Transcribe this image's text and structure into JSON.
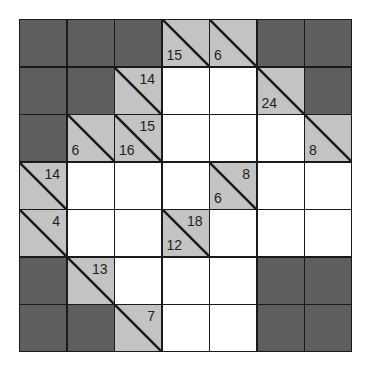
{
  "puzzle": {
    "type": "kakuro",
    "rows": 7,
    "cols": 7,
    "colors": {
      "blocked": "#5e5e5e",
      "clue": "#c3c3c3",
      "empty": "#ffffff",
      "line": "#1a1a1a"
    },
    "grid": [
      [
        {
          "t": "blocked"
        },
        {
          "t": "blocked"
        },
        {
          "t": "blocked"
        },
        {
          "t": "clue",
          "down": "15"
        },
        {
          "t": "clue",
          "down": "6"
        },
        {
          "t": "blocked"
        },
        {
          "t": "blocked"
        }
      ],
      [
        {
          "t": "blocked"
        },
        {
          "t": "blocked"
        },
        {
          "t": "clue",
          "across": "14"
        },
        {
          "t": "empty"
        },
        {
          "t": "empty"
        },
        {
          "t": "clue",
          "down": "24"
        },
        {
          "t": "blocked"
        }
      ],
      [
        {
          "t": "blocked"
        },
        {
          "t": "clue",
          "down": "6"
        },
        {
          "t": "clue",
          "across": "15",
          "down": "16"
        },
        {
          "t": "empty"
        },
        {
          "t": "empty"
        },
        {
          "t": "empty"
        },
        {
          "t": "clue",
          "down": "8"
        }
      ],
      [
        {
          "t": "clue",
          "across": "14"
        },
        {
          "t": "empty"
        },
        {
          "t": "empty"
        },
        {
          "t": "empty"
        },
        {
          "t": "clue",
          "across": "8",
          "down": "6"
        },
        {
          "t": "empty"
        },
        {
          "t": "empty"
        }
      ],
      [
        {
          "t": "clue",
          "across": "4"
        },
        {
          "t": "empty"
        },
        {
          "t": "empty"
        },
        {
          "t": "clue",
          "across": "18",
          "down": "12"
        },
        {
          "t": "empty"
        },
        {
          "t": "empty"
        },
        {
          "t": "empty"
        }
      ],
      [
        {
          "t": "blocked"
        },
        {
          "t": "clue",
          "across": "13"
        },
        {
          "t": "empty"
        },
        {
          "t": "empty"
        },
        {
          "t": "empty"
        },
        {
          "t": "blocked"
        },
        {
          "t": "blocked"
        }
      ],
      [
        {
          "t": "blocked"
        },
        {
          "t": "blocked"
        },
        {
          "t": "clue",
          "across": "7"
        },
        {
          "t": "empty"
        },
        {
          "t": "empty"
        },
        {
          "t": "blocked"
        },
        {
          "t": "blocked"
        }
      ]
    ]
  }
}
